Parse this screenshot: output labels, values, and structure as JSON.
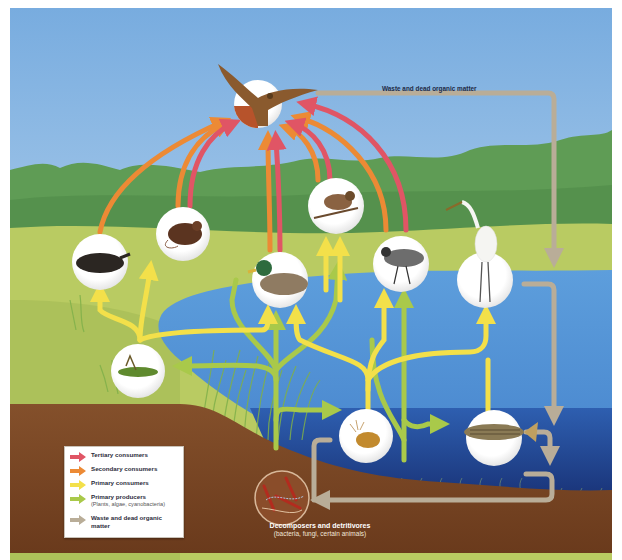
{
  "diagram": {
    "top_label": "Waste and dead organic matter",
    "decomposers": {
      "label": "Decomposers and detritivores",
      "sublabel": "(bacteria, fungi, certain animals)"
    },
    "organisms": [
      {
        "id": "hawk",
        "name": "Hawk",
        "level": "Tertiary consumer"
      },
      {
        "id": "mole",
        "name": "Mole",
        "level": "Secondary consumer"
      },
      {
        "id": "mouse",
        "name": "Mouse",
        "level": "Primary/secondary consumer"
      },
      {
        "id": "duck",
        "name": "Mallard duck",
        "level": "Primary consumer"
      },
      {
        "id": "sparrow",
        "name": "Sparrow",
        "level": "Primary consumer"
      },
      {
        "id": "plover",
        "name": "Plover",
        "level": "Secondary consumer"
      },
      {
        "id": "egret",
        "name": "Egret",
        "level": "Secondary consumer"
      },
      {
        "id": "grasshopper",
        "name": "Grasshopper",
        "level": "Primary consumer"
      },
      {
        "id": "zooplankton",
        "name": "Zooplankton",
        "level": "Primary consumer"
      },
      {
        "id": "fish",
        "name": "Striped bass",
        "level": "Secondary consumer"
      },
      {
        "id": "decomposers",
        "name": "Decomposers",
        "level": "Decomposer"
      }
    ]
  },
  "legend": {
    "items": [
      {
        "label": "Tertiary consumers",
        "sub": "",
        "color": "#e05565"
      },
      {
        "label": "Secondary consumers",
        "sub": "",
        "color": "#ec8a35"
      },
      {
        "label": "Primary consumers",
        "sub": "",
        "color": "#f3e04a"
      },
      {
        "label": "Primary producers",
        "sub": "(Plants, algae, cyanobacteria)",
        "color": "#a9c94a"
      },
      {
        "label": "Waste and dead organic matter",
        "sub": "",
        "color": "#b9ad98"
      }
    ]
  },
  "colors": {
    "sky_top": "#7fb2e3",
    "sky_bottom": "#cfe3f2",
    "trees": "#5e9b52",
    "meadow": "#b7c95f",
    "water": "#5c9ad8",
    "deep_water": "#1d3e8a",
    "soil": "#7a4524",
    "tertiary": "#e05565",
    "secondary": "#ec8a35",
    "primary": "#f3e04a",
    "producer": "#a9c94a",
    "waste": "#b9ad98"
  }
}
